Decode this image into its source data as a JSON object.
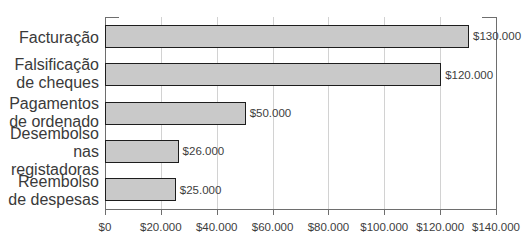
{
  "chart_data": {
    "type": "bar",
    "orientation": "horizontal",
    "title": "",
    "subtitle": "",
    "xlabel": "",
    "ylabel": "",
    "categories": [
      "Facturação",
      "Falsificação de cheques",
      "Pagamentos de ordenado",
      "Desembolso nas registadoras",
      "Reembolso de despesas"
    ],
    "category_lines": [
      [
        "Facturação"
      ],
      [
        "Falsificação",
        "de cheques"
      ],
      [
        "Pagamentos",
        "de ordenado"
      ],
      [
        "Desembolso",
        "nas registadoras"
      ],
      [
        "Reembolso",
        "de despesas"
      ]
    ],
    "values": [
      130000,
      120000,
      50000,
      26000,
      25000
    ],
    "value_labels": [
      "$130.000",
      "$120.000",
      "$50.000",
      "$26.000",
      "$25.000"
    ],
    "xlim": [
      0,
      140000
    ],
    "xticks": [
      0,
      20000,
      40000,
      60000,
      80000,
      100000,
      120000,
      140000
    ],
    "xtick_labels": [
      "$0",
      "$20.000",
      "$40.000",
      "$60.000",
      "$80.000",
      "$100.000",
      "$120.000",
      "$140.000"
    ],
    "grid": true,
    "grid_axis": "x",
    "legend": false,
    "legend_position": "none",
    "colors": {
      "bar_fill": "#c9c9c9",
      "bar_border": "#1d1d1d",
      "gridline": "#d2d2d2",
      "axis": "#6e6e6e",
      "text": "#3d3d3d",
      "background": "#ffffff"
    }
  }
}
